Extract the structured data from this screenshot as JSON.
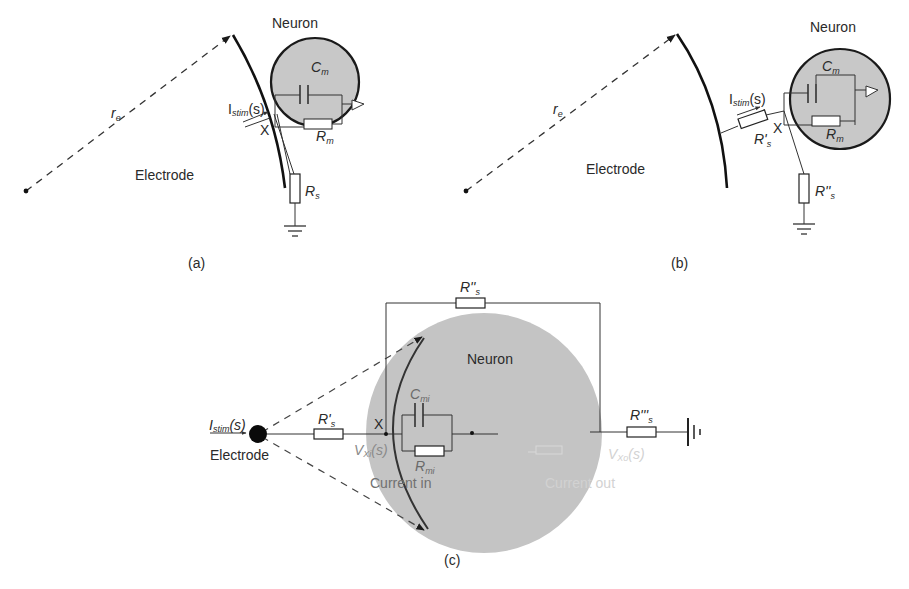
{
  "figure": {
    "colors": {
      "line": "#222222",
      "neuron_fill": "#c8c8c8",
      "neuron_fill_c": "#c4c4c4",
      "neuron_stroke": "#1a1a1a",
      "faint_text": "#d4d4d4",
      "background": "#ffffff"
    },
    "panel_a": {
      "caption": "(a)",
      "neuron_label": "Neuron",
      "electrode_label": "Electrode",
      "radius_label": {
        "main": "r",
        "sub": "e"
      },
      "cap_label": {
        "main": "C",
        "sub": "m"
      },
      "res_label": {
        "main": "R",
        "sub": "m"
      },
      "series_res_label": {
        "main": "R",
        "sub": "s"
      },
      "stim_label": {
        "main": "I",
        "sub": "stim",
        "tail": "(s)"
      },
      "node_label": "X"
    },
    "panel_b": {
      "caption": "(b)",
      "neuron_label": "Neuron",
      "electrode_label": "Electrode",
      "radius_label": {
        "main": "r",
        "sub": "e"
      },
      "cap_label": {
        "main": "C",
        "sub": "m"
      },
      "res_label": {
        "main": "R",
        "sub": "m"
      },
      "series_res1_label": {
        "main": "R'",
        "sub": "s"
      },
      "series_res2_label": {
        "main": "R''",
        "sub": "s"
      },
      "stim_label": {
        "main": "I",
        "sub": "stim",
        "tail": "(s)"
      },
      "node_label": "X"
    },
    "panel_c": {
      "caption": "(c)",
      "neuron_label": "Neuron",
      "electrode_label": "Electrode",
      "stim_label": {
        "main": "I",
        "sub": "stim",
        "tail": "(s)"
      },
      "series_res1_label": {
        "main": "R'",
        "sub": "s"
      },
      "bypass_res_label": {
        "main": "R''",
        "sub": "s"
      },
      "series_res3_label": {
        "main": "R'''",
        "sub": "s"
      },
      "cap_label": {
        "main": "C",
        "sub": "mi"
      },
      "res_label": {
        "main": "R",
        "sub": "mi"
      },
      "node_label": "X",
      "v_in_label": {
        "main": "V",
        "sub": "Xi",
        "tail": "(s)"
      },
      "v_out_label": {
        "main": "V",
        "sub": "Xo",
        "tail": "(s)"
      },
      "current_in_label": "Current in",
      "current_out_label": "Current out"
    }
  }
}
